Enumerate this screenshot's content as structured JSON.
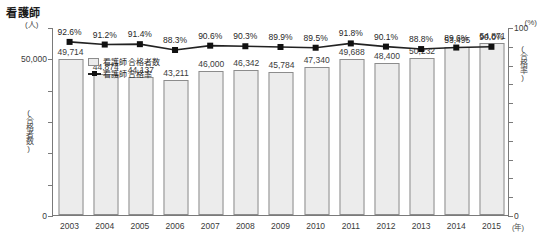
{
  "chart_data": {
    "type": "bar",
    "title": "看護師",
    "subtitle": "",
    "xlabel": "(年)",
    "ylabel": "(人) (合格者数)",
    "y2label": "(%) (合格率)",
    "categories": [
      "2003",
      "2004",
      "2005",
      "2006",
      "2007",
      "2008",
      "2009",
      "2010",
      "2011",
      "2012",
      "2013",
      "2014",
      "2015"
    ],
    "series": [
      {
        "name": "看護師 合格者数",
        "type": "bar",
        "axis": "left",
        "values": [
          49714,
          44874,
          44137,
          43211,
          46000,
          46342,
          45784,
          47340,
          49688,
          48400,
          50232,
          53495,
          54871
        ],
        "value_labels": [
          "49,714",
          "44,874",
          "44,137",
          "43,211",
          "46,000",
          "46,342",
          "45,784",
          "47,340",
          "49,688",
          "48,400",
          "50,232",
          "53,495",
          "54,871"
        ]
      },
      {
        "name": "看護師 合格率",
        "type": "line",
        "axis": "right",
        "values": [
          92.6,
          91.2,
          91.4,
          88.3,
          90.6,
          90.3,
          89.9,
          89.5,
          91.8,
          90.1,
          88.8,
          89.6,
          90.0
        ],
        "value_labels": [
          "92.6%",
          "91.2%",
          "91.4%",
          "88.3%",
          "90.6%",
          "90.3%",
          "89.9%",
          "89.5%",
          "91.8%",
          "90.1%",
          "88.8%",
          "89.6%",
          "90.0%"
        ]
      }
    ],
    "ylim": [
      0,
      60000
    ],
    "yticks": [
      0,
      50000
    ],
    "ytick_labels": [
      "0",
      "50,000"
    ],
    "y2lim": [
      0,
      100
    ],
    "y2ticks": [
      0,
      100
    ],
    "y2tick_labels": [
      "0",
      "100"
    ],
    "grid": false,
    "legend_position": "inside-upper-left",
    "colors": {
      "bar_fill": "#ececec",
      "bar_border": "#8c8c8c",
      "line": "#222222",
      "marker": "#111111",
      "axis": "#7a7a7a",
      "text": "#3a3a3a"
    }
  },
  "axes": {
    "left_unit": "(人)",
    "left_title": "(合格者数)",
    "right_unit": "(%)",
    "right_title": "(合格率)",
    "x_unit": "(年)"
  },
  "legend": {
    "items": [
      {
        "label": "看護師 合格者数",
        "marker": "bar-swatch-icon"
      },
      {
        "label": "看護師 合格率",
        "marker": "line-marker-icon"
      }
    ]
  }
}
